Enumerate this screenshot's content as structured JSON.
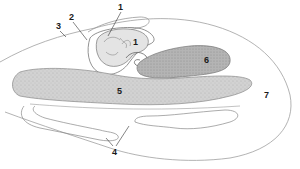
{
  "figure": {
    "type": "anatomical cross-section diagram",
    "colors": {
      "outline": "#8a8a8a",
      "dark_outline": "#555555",
      "shaded_region": "#c9c9c9",
      "dark_shaded_region": "#a9a9a9",
      "background": "#ffffff",
      "label": "#1a1a1a"
    },
    "labels": [
      {
        "id": "label-1-top",
        "text": "1",
        "x": 118,
        "y": 3
      },
      {
        "id": "label-1-inner",
        "text": "1",
        "x": 133,
        "y": 38
      },
      {
        "id": "label-2",
        "text": "2",
        "x": 69,
        "y": 13
      },
      {
        "id": "label-3",
        "text": "3",
        "x": 56,
        "y": 22
      },
      {
        "id": "label-4",
        "text": "4",
        "x": 112,
        "y": 153
      },
      {
        "id": "label-5",
        "text": "5",
        "x": 117,
        "y": 89
      },
      {
        "id": "label-6",
        "text": "6",
        "x": 204,
        "y": 56
      },
      {
        "id": "label-7",
        "text": "7",
        "x": 264,
        "y": 91
      }
    ]
  }
}
